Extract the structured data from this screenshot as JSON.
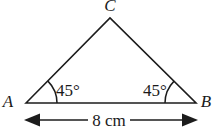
{
  "figure": {
    "type": "geometry-diagram",
    "shape": "triangle",
    "background_color": "#ffffff",
    "line_color": "#1c1c1c",
    "text_color": "#1a1a1a",
    "vertices": [
      {
        "name": "vertex-label-a",
        "label": "A",
        "x": 26,
        "y": 103,
        "label_x": 8,
        "label_y": 107
      },
      {
        "name": "vertex-label-b",
        "label": "B",
        "x": 196,
        "y": 103,
        "label_x": 202,
        "label_y": 107
      },
      {
        "name": "vertex-label-c",
        "label": "C",
        "x": 110,
        "y": 18,
        "label_x": 110,
        "label_y": 9
      }
    ],
    "angles": [
      {
        "name": "angle-label-a",
        "label": "45°",
        "at_vertex": "A",
        "label_x": 56,
        "label_y": 95
      },
      {
        "name": "angle-label-b",
        "label": "45°",
        "at_vertex": "B",
        "label_x": 143,
        "label_y": 95
      }
    ],
    "dimension": {
      "name": "base-dimension",
      "label": "8 cm",
      "value": 8,
      "unit": "cm",
      "from_x": 26,
      "to_x": 196,
      "y": 120,
      "label_x": 108,
      "label_y": 126,
      "arrow_style": "double-headed"
    }
  }
}
